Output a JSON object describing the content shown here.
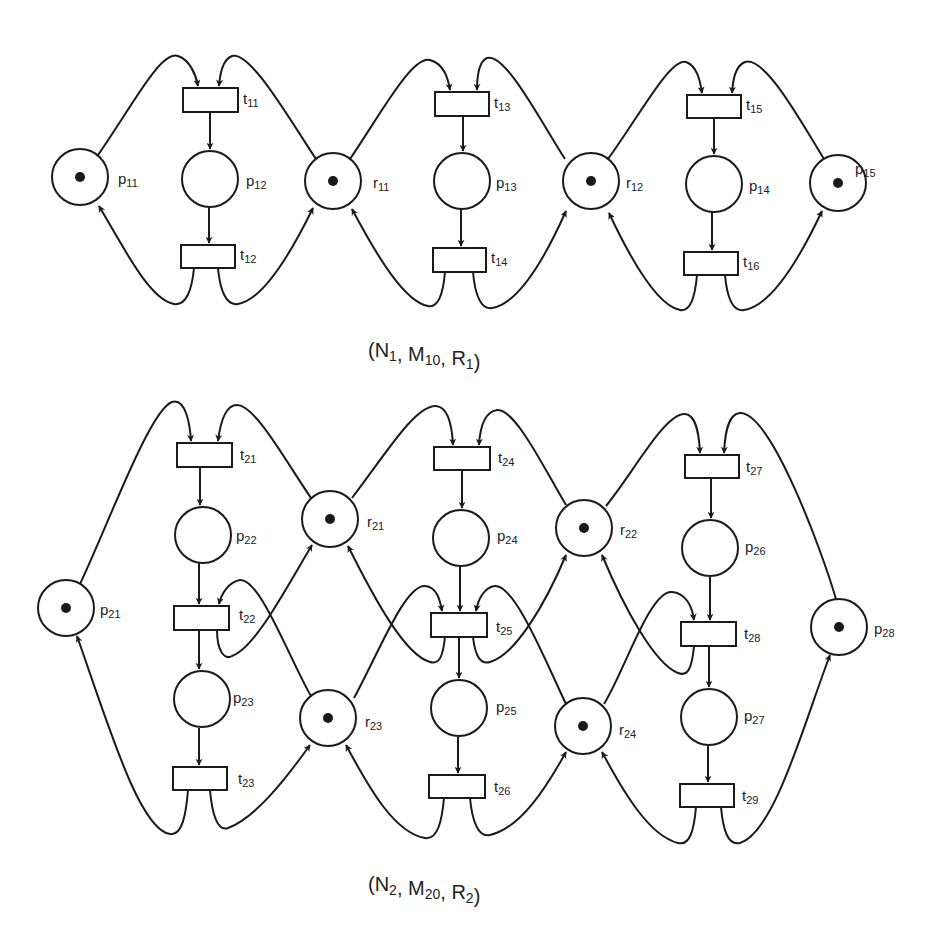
{
  "diagram": {
    "type": "petri-net",
    "colors": {
      "stroke": "#1a1a1a",
      "background": "#ffffff",
      "text": "#222222"
    },
    "nets": [
      {
        "id": "net1",
        "caption": {
          "text": "(N1, M10, R1)",
          "parts": [
            [
              "(N",
              "1"
            ],
            [
              ", M",
              "10"
            ],
            [
              ", R",
              "1"
            ],
            [
              ")",
              ""
            ]
          ],
          "x": 368,
          "y": 357
        },
        "places": [
          {
            "id": "p11",
            "base": "p",
            "sub": "11",
            "x": 80,
            "y": 177,
            "token": true,
            "lx": 118,
            "ly": 184
          },
          {
            "id": "p12",
            "base": "p",
            "sub": "12",
            "x": 210,
            "y": 179,
            "token": false,
            "lx": 246,
            "ly": 186
          },
          {
            "id": "r11",
            "base": "r",
            "sub": "11",
            "x": 333,
            "y": 181,
            "token": true,
            "lx": 373,
            "ly": 188
          },
          {
            "id": "p13",
            "base": "p",
            "sub": "13",
            "x": 462,
            "y": 181,
            "token": false,
            "lx": 496,
            "ly": 188
          },
          {
            "id": "r12",
            "base": "r",
            "sub": "12",
            "x": 591,
            "y": 181,
            "token": true,
            "lx": 626,
            "ly": 188
          },
          {
            "id": "p14",
            "base": "p",
            "sub": "14",
            "x": 714,
            "y": 184,
            "token": false,
            "lx": 749,
            "ly": 191
          },
          {
            "id": "p15",
            "base": "p",
            "sub": "15",
            "x": 838,
            "y": 183,
            "token": true,
            "lx": 855,
            "ly": 174
          }
        ],
        "transitions": [
          {
            "id": "t11",
            "base": "t",
            "sub": "11",
            "x": 183,
            "y": 88,
            "w": 55,
            "h": 24,
            "lx": 243,
            "ly": 104
          },
          {
            "id": "t12",
            "base": "t",
            "sub": "12",
            "x": 181,
            "y": 245,
            "w": 54,
            "h": 23,
            "lx": 240,
            "ly": 260
          },
          {
            "id": "t13",
            "base": "t",
            "sub": "13",
            "x": 435,
            "y": 92,
            "w": 54,
            "h": 24,
            "lx": 494,
            "ly": 108
          },
          {
            "id": "t14",
            "base": "t",
            "sub": "14",
            "x": 433,
            "y": 248,
            "w": 53,
            "h": 24,
            "lx": 491,
            "ly": 263
          },
          {
            "id": "t15",
            "base": "t",
            "sub": "15",
            "x": 687,
            "y": 95,
            "w": 54,
            "h": 23,
            "lx": 746,
            "ly": 110
          },
          {
            "id": "t16",
            "base": "t",
            "sub": "16",
            "x": 684,
            "y": 252,
            "w": 54,
            "h": 23,
            "lx": 743,
            "ly": 267
          }
        ],
        "arcs": [
          {
            "from": "p11",
            "to": "t11",
            "d": "M98,155 C130,110 160,50 178,56 C190,60 196,75 198,86",
            "arrow": true
          },
          {
            "from": "r11",
            "to": "t11",
            "d": "M316,159 C290,120 250,50 232,56 C222,60 220,75 219,86",
            "arrow": true
          },
          {
            "from": "t11",
            "to": "p12",
            "d": "M210,112 L210,149",
            "arrow": true
          },
          {
            "from": "p12",
            "to": "t12",
            "d": "M209,207 L209,243",
            "arrow": true
          },
          {
            "from": "t12",
            "to": "p11",
            "d": "M194,268 C192,290 186,306 174,304 C150,300 125,250 99,206",
            "arrow": true
          },
          {
            "from": "t12",
            "to": "r11",
            "d": "M218,268 C220,290 226,306 238,304 C262,300 290,255 313,208",
            "arrow": true
          },
          {
            "from": "r11",
            "to": "t13",
            "d": "M350,159 C380,115 412,55 430,60 C444,64 448,78 450,90",
            "arrow": true
          },
          {
            "from": "r12",
            "to": "t13",
            "d": "M565,159 C540,120 505,52 487,58 C478,62 477,78 477,90",
            "arrow": true
          },
          {
            "from": "t13",
            "to": "p13",
            "d": "M463,116 L463,151",
            "arrow": true
          },
          {
            "from": "p13",
            "to": "t14",
            "d": "M461,209 L461,246",
            "arrow": true
          },
          {
            "from": "t14",
            "to": "r11",
            "d": "M445,272 C443,295 438,308 428,306 C405,302 378,258 352,209",
            "arrow": true
          },
          {
            "from": "t14",
            "to": "r12",
            "d": "M473,272 C475,295 481,310 492,308 C518,304 545,258 566,211",
            "arrow": true
          },
          {
            "from": "r12",
            "to": "t15",
            "d": "M608,159 C640,115 670,58 686,62 C697,66 700,80 702,93",
            "arrow": true
          },
          {
            "from": "p15",
            "to": "t15",
            "d": "M824,159 C800,120 765,56 745,62 C735,66 733,80 732,93",
            "arrow": true
          },
          {
            "from": "t15",
            "to": "p14",
            "d": "M714,118 L714,154",
            "arrow": true
          },
          {
            "from": "p14",
            "to": "t16",
            "d": "M712,212 L712,250",
            "arrow": true
          },
          {
            "from": "t16",
            "to": "r12",
            "d": "M697,275 C695,298 690,312 680,310 C658,306 632,262 609,213",
            "arrow": true
          },
          {
            "from": "t16",
            "to": "p15",
            "d": "M725,275 C727,298 733,312 744,310 C770,306 798,262 822,211",
            "arrow": true
          }
        ]
      },
      {
        "id": "net2",
        "caption": {
          "text": "(N2, M20, R2)",
          "parts": [
            [
              "(N",
              "2"
            ],
            [
              ", M",
              "20"
            ],
            [
              ", R",
              "2"
            ],
            [
              ")",
              ""
            ]
          ],
          "x": 368,
          "y": 891
        },
        "places": [
          {
            "id": "p21",
            "base": "p",
            "sub": "21",
            "x": 66,
            "y": 608,
            "token": true,
            "lx": 100,
            "ly": 615
          },
          {
            "id": "p22",
            "base": "p",
            "sub": "22",
            "x": 203,
            "y": 535,
            "token": false,
            "lx": 236,
            "ly": 541
          },
          {
            "id": "p23",
            "base": "p",
            "sub": "23",
            "x": 202,
            "y": 699,
            "token": false,
            "lx": 233,
            "ly": 703
          },
          {
            "id": "r21",
            "base": "r",
            "sub": "21",
            "x": 330,
            "y": 519,
            "token": true,
            "lx": 367,
            "ly": 527
          },
          {
            "id": "r23",
            "base": "r",
            "sub": "23",
            "x": 328,
            "y": 718,
            "token": true,
            "lx": 365,
            "ly": 727
          },
          {
            "id": "p24",
            "base": "p",
            "sub": "24",
            "x": 461,
            "y": 538,
            "token": false,
            "lx": 497,
            "ly": 541
          },
          {
            "id": "p25",
            "base": "p",
            "sub": "25",
            "x": 459,
            "y": 708,
            "token": false,
            "lx": 496,
            "ly": 712
          },
          {
            "id": "r22",
            "base": "r",
            "sub": "22",
            "x": 584,
            "y": 528,
            "token": true,
            "lx": 620,
            "ly": 535
          },
          {
            "id": "r24",
            "base": "r",
            "sub": "24",
            "x": 583,
            "y": 726,
            "token": true,
            "lx": 619,
            "ly": 735
          },
          {
            "id": "p26",
            "base": "p",
            "sub": "26",
            "x": 710,
            "y": 548,
            "token": false,
            "lx": 745,
            "ly": 552
          },
          {
            "id": "p27",
            "base": "p",
            "sub": "27",
            "x": 709,
            "y": 717,
            "token": false,
            "lx": 744,
            "ly": 721
          },
          {
            "id": "p28",
            "base": "p",
            "sub": "28",
            "x": 839,
            "y": 627,
            "token": true,
            "lx": 874,
            "ly": 634
          }
        ],
        "transitions": [
          {
            "id": "t21",
            "base": "t",
            "sub": "21",
            "x": 177,
            "y": 443,
            "w": 55,
            "h": 24,
            "lx": 240,
            "ly": 460
          },
          {
            "id": "t22",
            "base": "t",
            "sub": "22",
            "x": 174,
            "y": 606,
            "w": 55,
            "h": 24,
            "lx": 239,
            "ly": 620
          },
          {
            "id": "t23",
            "base": "t",
            "sub": "23",
            "x": 173,
            "y": 767,
            "w": 54,
            "h": 23,
            "lx": 238,
            "ly": 784
          },
          {
            "id": "t24",
            "base": "t",
            "sub": "24",
            "x": 434,
            "y": 447,
            "w": 56,
            "h": 23,
            "lx": 498,
            "ly": 463
          },
          {
            "id": "t25",
            "base": "t",
            "sub": "25",
            "x": 431,
            "y": 613,
            "w": 56,
            "h": 24,
            "lx": 496,
            "ly": 632
          },
          {
            "id": "t26",
            "base": "t",
            "sub": "26",
            "x": 429,
            "y": 775,
            "w": 56,
            "h": 23,
            "lx": 494,
            "ly": 792
          },
          {
            "id": "t27",
            "base": "t",
            "sub": "27",
            "x": 685,
            "y": 455,
            "w": 54,
            "h": 23,
            "lx": 746,
            "ly": 472
          },
          {
            "id": "t28",
            "base": "t",
            "sub": "28",
            "x": 681,
            "y": 622,
            "w": 55,
            "h": 24,
            "lx": 744,
            "ly": 639
          },
          {
            "id": "t29",
            "base": "t",
            "sub": "29",
            "x": 680,
            "y": 784,
            "w": 54,
            "h": 23,
            "lx": 742,
            "ly": 801
          }
        ],
        "arcs": [
          {
            "from": "p21",
            "to": "t21",
            "d": "M80,584 C110,520 150,410 172,402 C186,398 190,425 191,441",
            "arrow": true
          },
          {
            "from": "r21",
            "to": "t21",
            "d": "M311,498 C285,460 255,405 237,405 C225,405 220,425 218,441",
            "arrow": true
          },
          {
            "from": "t21",
            "to": "p22",
            "d": "M200,467 L200,505",
            "arrow": true
          },
          {
            "from": "p22",
            "to": "t22",
            "d": "M199,563 L199,604",
            "arrow": true
          },
          {
            "from": "r23",
            "to": "t22",
            "d": "M311,696 C290,660 260,578 240,580 C228,582 221,595 219,604",
            "arrow": true
          },
          {
            "from": "t22",
            "to": "r21",
            "d": "M217,630 C217,652 225,660 232,656 C255,648 285,590 312,545",
            "arrow": true
          },
          {
            "from": "t22",
            "to": "p23",
            "d": "M199,630 L199,669",
            "arrow": true
          },
          {
            "from": "p23",
            "to": "t23",
            "d": "M199,728 L199,765",
            "arrow": true
          },
          {
            "from": "t23",
            "to": "p21",
            "d": "M188,790 C186,815 182,836 170,834 C140,830 110,730 77,636",
            "arrow": true
          },
          {
            "from": "t23",
            "to": "r23",
            "d": "M210,790 C212,815 218,832 228,828 C255,818 285,780 310,745",
            "arrow": true
          },
          {
            "from": "r21",
            "to": "t24",
            "d": "M352,498 C385,455 415,405 436,406 C448,407 452,425 453,445",
            "arrow": true
          },
          {
            "from": "r22",
            "to": "t24",
            "d": "M566,505 C545,470 515,408 497,410 C484,412 480,428 479,445",
            "arrow": true
          },
          {
            "from": "t24",
            "to": "p24",
            "d": "M462,470 L462,508",
            "arrow": true
          },
          {
            "from": "p24",
            "to": "t25",
            "d": "M460,567 L460,611",
            "arrow": true
          },
          {
            "from": "r23",
            "to": "t25",
            "d": "M354,698 C380,650 405,585 425,586 C437,587 440,600 442,611",
            "arrow": true
          },
          {
            "from": "r24",
            "to": "t25",
            "d": "M566,704 C545,660 515,585 495,586 C484,587 478,600 476,611",
            "arrow": true
          },
          {
            "from": "t25",
            "to": "r21",
            "d": "M445,637 C443,655 440,665 430,662 C405,655 375,600 348,546",
            "arrow": true
          },
          {
            "from": "t25",
            "to": "r22",
            "d": "M473,637 C475,655 480,665 490,662 C515,655 545,605 566,555",
            "arrow": true
          },
          {
            "from": "t25",
            "to": "p25",
            "d": "M459,637 L459,678",
            "arrow": true
          },
          {
            "from": "p25",
            "to": "t26",
            "d": "M458,737 L458,773",
            "arrow": true
          },
          {
            "from": "t26",
            "to": "r23",
            "d": "M444,798 C442,820 438,840 425,838 C395,833 370,790 346,745",
            "arrow": true
          },
          {
            "from": "t26",
            "to": "r24",
            "d": "M470,798 C472,820 478,838 490,835 C520,828 545,790 566,752",
            "arrow": true
          },
          {
            "from": "r22",
            "to": "t27",
            "d": "M606,506 C635,470 665,413 685,414 C696,415 699,433 700,453",
            "arrow": true
          },
          {
            "from": "p28",
            "to": "t27",
            "d": "M836,599 C820,545 770,412 740,413 C728,414 725,433 724,453",
            "arrow": true
          },
          {
            "from": "t27",
            "to": "p26",
            "d": "M711,478 L711,518",
            "arrow": true
          },
          {
            "from": "p26",
            "to": "t28",
            "d": "M710,577 L710,620",
            "arrow": true
          },
          {
            "from": "r24",
            "to": "t28",
            "d": "M604,704 C625,670 650,590 672,592 C685,593 692,605 694,620",
            "arrow": true
          },
          {
            "from": "t28",
            "to": "r22",
            "d": "M694,646 C692,668 688,677 678,673 C655,664 625,610 602,555",
            "arrow": true
          },
          {
            "from": "t28",
            "to": "p27",
            "d": "M709,646 L709,687",
            "arrow": true
          },
          {
            "from": "p27",
            "to": "t29",
            "d": "M708,746 L708,782",
            "arrow": true
          },
          {
            "from": "t29",
            "to": "r24",
            "d": "M696,807 C694,830 690,846 678,843 C650,836 625,795 602,752",
            "arrow": true
          },
          {
            "from": "t29",
            "to": "p28",
            "d": "M721,807 C723,830 728,846 740,843 C775,832 805,720 830,655",
            "arrow": true
          }
        ]
      }
    ]
  }
}
